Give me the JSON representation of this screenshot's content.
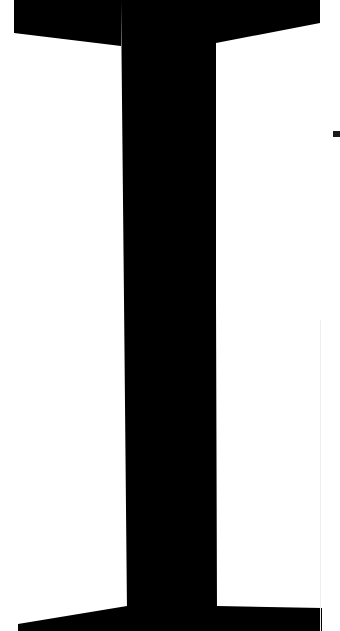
{
  "view": {
    "name": "magnified-glyph-view",
    "width": 340,
    "height": 631,
    "background_color": "#ffffff",
    "description": "Extreme close-up crop of a single rendered text character filling the frame"
  },
  "glyph": {
    "character": "T",
    "semantic_name": "letter-t-glyph",
    "typeface_style": "serif",
    "fill_color": "#000000",
    "coverage": "fills frame, edges cropped at left and right",
    "parts": [
      {
        "name": "top-crossbar",
        "description": "wide horizontal arm across the top of the letter",
        "x_start": 14,
        "x_end": 320,
        "y_start": 0,
        "y_end": 44
      },
      {
        "name": "vertical-stem",
        "description": "central upright column of the letter",
        "x_start": 121,
        "x_end": 216,
        "y_start": 0,
        "y_end": 612
      },
      {
        "name": "bottom-serif-foot",
        "description": "flared horizontal base serif at the bottom",
        "x_start": 18,
        "x_end": 322,
        "y_start": 606,
        "y_end": 631
      }
    ]
  },
  "artifacts": {
    "vertical_hairline": {
      "name": "antialias-hairline",
      "color": "#ededf0",
      "x": 320,
      "y_start": 320,
      "y_end": 631,
      "width": 1
    },
    "edge_tick": {
      "name": "edge-tick-mark",
      "color": "#1a1a1a",
      "x": 333,
      "y": 131,
      "width": 7,
      "height": 6
    }
  },
  "colors": {
    "ink": "#000000",
    "paper": "#ffffff",
    "hairline": "#ededf0",
    "tick": "#1a1a1a"
  }
}
